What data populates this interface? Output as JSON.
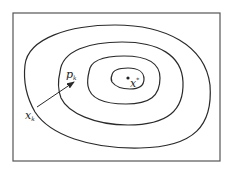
{
  "diagram": {
    "type": "contour-plot",
    "labels": {
      "start_point": "x",
      "start_point_sub": "k",
      "direction": "p",
      "direction_sub": "k",
      "minimizer": "x",
      "minimizer_sup": "*"
    },
    "contour_count": 4,
    "colors": {
      "line": "#2a2a2a",
      "frame": "#555555",
      "background": "#ffffff"
    }
  }
}
